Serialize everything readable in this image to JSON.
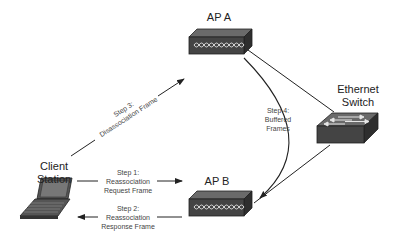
{
  "nodes": {
    "ap_a": {
      "label": "AP A"
    },
    "ap_b": {
      "label": "AP B"
    },
    "switch": {
      "label_line1": "Ethernet",
      "label_line2": "Switch"
    },
    "client": {
      "label_line1": "Client",
      "label_line2": "Station"
    }
  },
  "steps": {
    "step1": {
      "line1": "Step 1:",
      "line2": "Reassociation",
      "line3": "Request Frame"
    },
    "step2": {
      "line1": "Step 2:",
      "line2": "Reassociation",
      "line3": "Response Frame"
    },
    "step3": {
      "line1": "Step 3:",
      "line2": "Disassociation Frame"
    },
    "step4": {
      "line1": "Step 4:",
      "line2": "Buffered",
      "line3": "Frames"
    }
  },
  "colors": {
    "device_dark": "#3a3a3a",
    "device_top": "#5a5a5a",
    "line": "#222222"
  }
}
